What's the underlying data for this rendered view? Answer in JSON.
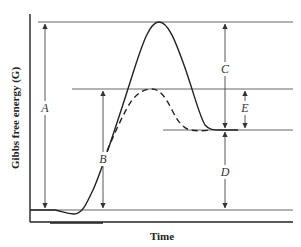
{
  "diagram": {
    "type": "energy-profile",
    "x_axis_label": "Time",
    "y_axis_label": "Gibbs free energy (G)",
    "dimension_labels": {
      "A": "A",
      "B": "B",
      "C": "C",
      "D": "D",
      "E": "E"
    },
    "curves": [
      {
        "name": "uncatalyzed",
        "style": "solid"
      },
      {
        "name": "catalyzed",
        "style": "dashed"
      }
    ],
    "colors": {
      "line": "#222222",
      "guide": "#555555",
      "background": "#ffffff"
    }
  }
}
